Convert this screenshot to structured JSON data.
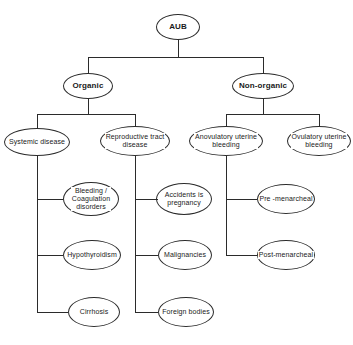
{
  "diagram": {
    "type": "tree-flowchart",
    "background_color": "#ffffff",
    "line_color": "#2b2b2b",
    "text_color": "#1a1a1a",
    "nodes": [
      {
        "id": "aub",
        "label": "AUB",
        "level": "root",
        "shape": "ellipse",
        "x": 156,
        "y": 14,
        "w": 44,
        "h": 26,
        "class": "n-root"
      },
      {
        "id": "organic",
        "label": "Organic",
        "level": "l1",
        "shape": "ellipse",
        "x": 63,
        "y": 73,
        "w": 50,
        "h": 26,
        "class": "n-l1"
      },
      {
        "id": "non-organic",
        "label": "Non-organic",
        "level": "l1",
        "shape": "ellipse",
        "x": 232,
        "y": 73,
        "w": 62,
        "h": 26,
        "class": "n-l1"
      },
      {
        "id": "systemic-disease",
        "label": "Systemic disease",
        "level": "l2",
        "shape": "ellipse",
        "x": 4,
        "y": 128,
        "w": 66,
        "h": 28,
        "class": "n-l2"
      },
      {
        "id": "reproductive-tract-disease",
        "label": "Reproductive tract\ndisease",
        "level": "l2",
        "shape": "ellipse",
        "x": 100,
        "y": 126,
        "w": 70,
        "h": 30,
        "class": "n-l2"
      },
      {
        "id": "anovulatory-uterine-bleeding",
        "label": "Anovulatory uterine\nbleeding",
        "level": "l2",
        "shape": "ellipse",
        "x": 189,
        "y": 126,
        "w": 74,
        "h": 30,
        "class": "n-l2"
      },
      {
        "id": "ovulatory-uterine-bleeding",
        "label": "Ovulatory uterine\nbleeding",
        "level": "l2",
        "shape": "ellipse",
        "x": 287,
        "y": 126,
        "w": 64,
        "h": 30,
        "class": "n-l2"
      },
      {
        "id": "bleeding-coagulation-disorders",
        "label": "Bleeding /\nCoagulation\ndisorders",
        "level": "l3",
        "shape": "ellipse",
        "x": 63,
        "y": 182,
        "w": 56,
        "h": 34,
        "class": "n-l3"
      },
      {
        "id": "accidents-is-pregnancy",
        "label": "Accidents is\npregnancy",
        "level": "l3",
        "shape": "ellipse",
        "x": 156,
        "y": 183,
        "w": 56,
        "h": 32,
        "class": "n-l3"
      },
      {
        "id": "pre-menarcheal",
        "label": "Pre -menarcheal",
        "level": "l3",
        "shape": "ellipse",
        "x": 257,
        "y": 184,
        "w": 58,
        "h": 30,
        "class": "n-l3"
      },
      {
        "id": "hypothyroidism",
        "label": "Hypothyroidism",
        "level": "l3",
        "shape": "ellipse",
        "x": 63,
        "y": 240,
        "w": 58,
        "h": 30,
        "class": "n-l3"
      },
      {
        "id": "malignancies",
        "label": "Malignancies",
        "level": "l3",
        "shape": "ellipse",
        "x": 158,
        "y": 240,
        "w": 54,
        "h": 30,
        "class": "n-l3"
      },
      {
        "id": "post-menarcheal",
        "label": "Post-menarcheal",
        "level": "l3",
        "shape": "ellipse",
        "x": 257,
        "y": 240,
        "w": 58,
        "h": 30,
        "class": "n-l3"
      },
      {
        "id": "cirrhosis",
        "label": "Cirrhosis",
        "level": "l3",
        "shape": "ellipse",
        "x": 68,
        "y": 297,
        "w": 52,
        "h": 30,
        "class": "n-l3"
      },
      {
        "id": "foreign-bodies",
        "label": "Foreign bodies",
        "level": "l3",
        "shape": "ellipse",
        "x": 158,
        "y": 297,
        "w": 56,
        "h": 30,
        "class": "n-l3"
      }
    ],
    "edges": [
      {
        "from": "aub",
        "to": "organic",
        "style": "orthogonal-split"
      },
      {
        "from": "aub",
        "to": "non-organic",
        "style": "orthogonal-split"
      },
      {
        "from": "organic",
        "to": "systemic-disease",
        "style": "orthogonal-split"
      },
      {
        "from": "organic",
        "to": "reproductive-tract-disease",
        "style": "orthogonal-split"
      },
      {
        "from": "non-organic",
        "to": "anovulatory-uterine-bleeding",
        "style": "orthogonal-split"
      },
      {
        "from": "non-organic",
        "to": "ovulatory-uterine-bleeding",
        "style": "orthogonal-split"
      },
      {
        "from": "systemic-disease",
        "to": "bleeding-coagulation-disorders",
        "style": "trunk-branch"
      },
      {
        "from": "systemic-disease",
        "to": "hypothyroidism",
        "style": "trunk-branch"
      },
      {
        "from": "systemic-disease",
        "to": "cirrhosis",
        "style": "trunk-branch"
      },
      {
        "from": "reproductive-tract-disease",
        "to": "accidents-is-pregnancy",
        "style": "trunk-branch"
      },
      {
        "from": "reproductive-tract-disease",
        "to": "malignancies",
        "style": "trunk-branch"
      },
      {
        "from": "reproductive-tract-disease",
        "to": "foreign-bodies",
        "style": "trunk-branch"
      },
      {
        "from": "anovulatory-uterine-bleeding",
        "to": "pre-menarcheal",
        "style": "trunk-branch"
      },
      {
        "from": "anovulatory-uterine-bleeding",
        "to": "post-menarcheal",
        "style": "trunk-branch"
      }
    ]
  }
}
